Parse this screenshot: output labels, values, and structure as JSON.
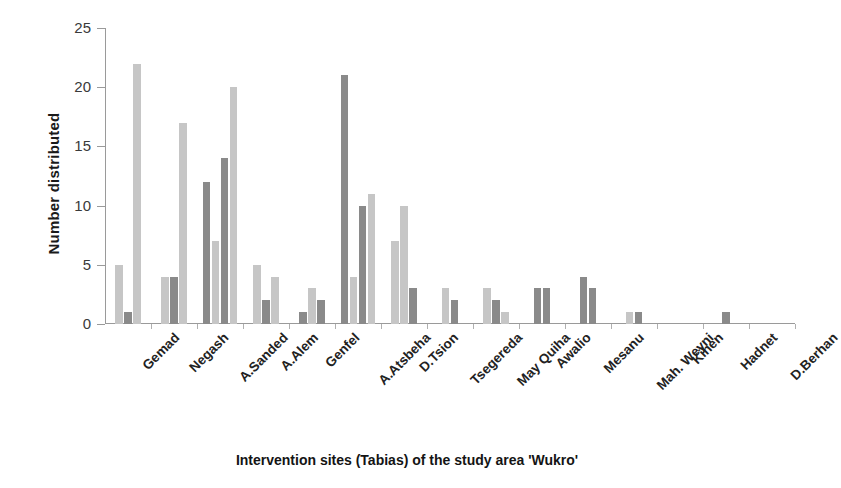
{
  "chart_data": {
    "type": "bar",
    "title": "",
    "xlabel": "Intervention sites (Tabias) of the study area 'Wukro'",
    "ylabel": "Number distributed",
    "ylim": [
      0,
      25
    ],
    "yticks": [
      0,
      5,
      10,
      15,
      20,
      25
    ],
    "grid": false,
    "legend": "none",
    "categories": [
      "Gemad",
      "Negash",
      "A.Sanded",
      "A.Alem",
      "Genfel",
      "A.Atsbeha",
      "D.Tsion",
      "Tsegereda",
      "May Quiha",
      "Awalio",
      "Mesanu",
      "Mah. Weyni",
      "Kihen",
      "Hadnet",
      "D.Berhan"
    ],
    "series": [
      {
        "name": "series-1",
        "color": "#c6c6c6",
        "values": [
          5,
          4,
          0,
          5,
          0,
          0,
          7,
          3,
          3,
          0,
          0,
          1,
          0,
          0,
          0
        ]
      },
      {
        "name": "series-2",
        "color": "#8a8a8a",
        "values": [
          1,
          4,
          12,
          2,
          1,
          21,
          0,
          2,
          2,
          3,
          4,
          1,
          0,
          1,
          0
        ]
      },
      {
        "name": "series-3",
        "color": "#c6c6c6",
        "values": [
          22,
          17,
          7,
          4,
          3,
          4,
          10,
          0,
          1,
          0,
          0,
          0,
          0,
          0,
          0
        ]
      },
      {
        "name": "series-4",
        "color": "#8a8a8a",
        "values": [
          0,
          0,
          14,
          0,
          2,
          10,
          3,
          0,
          0,
          3,
          3,
          0,
          0,
          0,
          0
        ]
      },
      {
        "name": "series-5",
        "color": "#c6c6c6",
        "values": [
          0,
          0,
          20,
          0,
          0,
          11,
          0,
          0,
          0,
          0,
          0,
          0,
          0,
          0,
          0
        ]
      }
    ]
  },
  "axis": {
    "y_title": "Number distributed",
    "x_title": "Intervention sites (Tabias) of the study area 'Wukro'"
  },
  "colors": {
    "bar_light": "#c6c6c6",
    "bar_dark": "#8a8a8a",
    "axis": "#9a9a9a",
    "text": "#1a1a1a",
    "background": "#ffffff"
  }
}
